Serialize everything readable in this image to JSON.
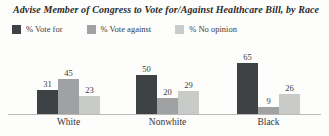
{
  "title": "Advise Member of Congress to Vote for/Against Healthcare Bill, by Race",
  "legend": {
    "items": [
      {
        "label": "% Vote for",
        "color": "#3f4245"
      },
      {
        "label": "% Vote against",
        "color": "#9fa1a3"
      },
      {
        "label": "% No opinion",
        "color": "#c9cbc8"
      }
    ]
  },
  "colors": {
    "vote_for": "#3f4245",
    "vote_against": "#9fa1a3",
    "no_opinion": "#c9cbc8",
    "baseline": "#b9b9b6"
  },
  "chart_data": {
    "type": "bar",
    "title": "Advise Member of Congress to Vote for/Against Healthcare Bill, by Race",
    "categories": [
      "White",
      "Nonwhite",
      "Black"
    ],
    "series": [
      {
        "name": "% Vote for",
        "color": "#3f4245",
        "values": [
          31,
          50,
          65
        ]
      },
      {
        "name": "% Vote against",
        "color": "#9fa1a3",
        "values": [
          45,
          20,
          9
        ]
      },
      {
        "name": "% No opinion",
        "color": "#c9cbc8",
        "values": [
          23,
          29,
          26
        ]
      }
    ],
    "xlabel": "",
    "ylabel": "",
    "ylim": [
      0,
      70
    ],
    "grid": false,
    "legend_position": "top",
    "value_labels_shown": true
  }
}
